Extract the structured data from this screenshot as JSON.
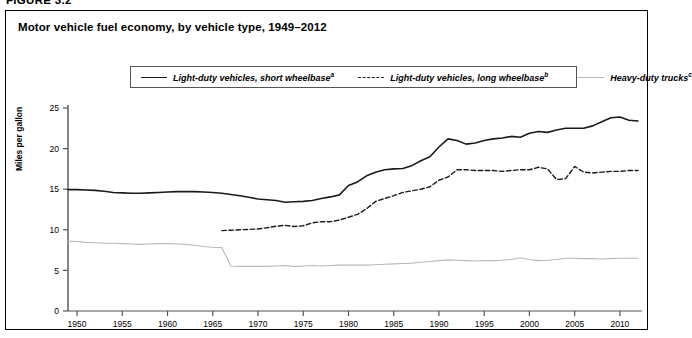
{
  "figure": {
    "number_label": "FIGURE 3.2"
  },
  "panel": {
    "title": "Motor vehicle fuel economy, by vehicle type, 1949–2012"
  },
  "legend": {
    "position": "top-center",
    "entries": [
      {
        "label": "Light-duty vehicles, short wheelbase",
        "footnote": "a",
        "style": "solid",
        "color": "#1a1a1a"
      },
      {
        "label": "Light-duty vehicles, long wheelbase",
        "footnote": "b",
        "style": "dashed",
        "color": "#1a1a1a"
      },
      {
        "label": "Heavy-duty trucks",
        "footnote": "c",
        "style": "solid",
        "color": "#b9b9b9"
      }
    ]
  },
  "chart_data": {
    "type": "line",
    "title": "Motor vehicle fuel economy, by vehicle type, 1949–2012",
    "xlabel": "",
    "ylabel": "Miles per gallon",
    "xlim": [
      1949,
      2012
    ],
    "ylim": [
      0,
      25
    ],
    "y_ticks": [
      0,
      5,
      10,
      15,
      20,
      25
    ],
    "x_ticks": [
      1950,
      1955,
      1960,
      1965,
      1970,
      1975,
      1980,
      1985,
      1990,
      1995,
      2000,
      2005,
      2010
    ],
    "grid": false,
    "legend_position": "top-center",
    "series": [
      {
        "name": "Light-duty vehicles, short wheelbase",
        "footnote": "a",
        "style": "solid",
        "color": "#1a1a1a",
        "x": [
          1949,
          1950,
          1951,
          1952,
          1953,
          1954,
          1955,
          1956,
          1957,
          1958,
          1959,
          1960,
          1961,
          1962,
          1963,
          1964,
          1965,
          1966,
          1967,
          1968,
          1969,
          1970,
          1971,
          1972,
          1973,
          1974,
          1975,
          1976,
          1977,
          1978,
          1979,
          1980,
          1981,
          1982,
          1983,
          1984,
          1985,
          1986,
          1987,
          1988,
          1989,
          1990,
          1991,
          1992,
          1993,
          1994,
          1995,
          1996,
          1997,
          1998,
          1999,
          2000,
          2001,
          2002,
          2003,
          2004,
          2005,
          2006,
          2007,
          2008,
          2009,
          2010,
          2011,
          2012
        ],
        "y": [
          14.95,
          14.95,
          14.9,
          14.85,
          14.75,
          14.6,
          14.55,
          14.5,
          14.5,
          14.55,
          14.6,
          14.65,
          14.7,
          14.7,
          14.7,
          14.65,
          14.6,
          14.5,
          14.35,
          14.2,
          14.0,
          13.8,
          13.7,
          13.6,
          13.4,
          13.45,
          13.5,
          13.6,
          13.85,
          14.05,
          14.3,
          15.45,
          15.9,
          16.65,
          17.1,
          17.4,
          17.5,
          17.55,
          17.9,
          18.5,
          19.0,
          20.2,
          21.2,
          21.0,
          20.55,
          20.7,
          21.0,
          21.2,
          21.3,
          21.5,
          21.4,
          21.9,
          22.1,
          22.0,
          22.3,
          22.5,
          22.5,
          22.5,
          22.8,
          23.3,
          23.8,
          23.9,
          23.5,
          23.4
        ]
      },
      {
        "name": "Light-duty vehicles, long wheelbase",
        "footnote": "b",
        "style": "dashed",
        "color": "#1a1a1a",
        "x": [
          1966,
          1967,
          1968,
          1969,
          1970,
          1971,
          1972,
          1973,
          1974,
          1975,
          1976,
          1977,
          1978,
          1979,
          1980,
          1981,
          1982,
          1983,
          1984,
          1985,
          1986,
          1987,
          1988,
          1989,
          1990,
          1991,
          1992,
          1993,
          1994,
          1995,
          1996,
          1997,
          1998,
          1999,
          2000,
          2001,
          2002,
          2003,
          2004,
          2005,
          2006,
          2007,
          2008,
          2009,
          2010,
          2011,
          2012
        ],
        "y": [
          9.9,
          9.95,
          10.0,
          10.05,
          10.1,
          10.25,
          10.45,
          10.55,
          10.4,
          10.5,
          10.85,
          11.0,
          11.0,
          11.2,
          11.55,
          11.9,
          12.6,
          13.5,
          13.85,
          14.2,
          14.6,
          14.8,
          15.0,
          15.3,
          16.1,
          16.5,
          17.4,
          17.4,
          17.3,
          17.3,
          17.3,
          17.2,
          17.3,
          17.4,
          17.4,
          17.7,
          17.5,
          16.2,
          16.3,
          17.8,
          17.1,
          17.0,
          17.1,
          17.2,
          17.2,
          17.3,
          17.3
        ]
      },
      {
        "name": "Heavy-duty trucks",
        "footnote": "c",
        "style": "solid",
        "color": "#b9b9b9",
        "x": [
          1949,
          1950,
          1951,
          1952,
          1953,
          1954,
          1955,
          1956,
          1957,
          1958,
          1959,
          1960,
          1961,
          1962,
          1963,
          1964,
          1965,
          1966,
          1967,
          1968,
          1969,
          1970,
          1971,
          1972,
          1973,
          1974,
          1975,
          1976,
          1977,
          1978,
          1979,
          1980,
          1981,
          1982,
          1983,
          1984,
          1985,
          1986,
          1987,
          1988,
          1989,
          1990,
          1991,
          1992,
          1993,
          1994,
          1995,
          1996,
          1997,
          1998,
          1999,
          2000,
          2001,
          2002,
          2003,
          2004,
          2005,
          2006,
          2007,
          2008,
          2009,
          2010,
          2011,
          2012
        ],
        "y": [
          8.6,
          8.55,
          8.45,
          8.4,
          8.35,
          8.35,
          8.3,
          8.25,
          8.2,
          8.25,
          8.3,
          8.3,
          8.25,
          8.2,
          8.1,
          7.95,
          7.85,
          7.8,
          5.55,
          5.5,
          5.5,
          5.5,
          5.5,
          5.55,
          5.6,
          5.5,
          5.55,
          5.6,
          5.55,
          5.6,
          5.65,
          5.65,
          5.65,
          5.65,
          5.7,
          5.75,
          5.8,
          5.85,
          5.9,
          6.0,
          6.1,
          6.2,
          6.3,
          6.25,
          6.2,
          6.15,
          6.2,
          6.2,
          6.25,
          6.35,
          6.55,
          6.35,
          6.2,
          6.25,
          6.35,
          6.5,
          6.5,
          6.45,
          6.45,
          6.4,
          6.45,
          6.5,
          6.5,
          6.5
        ]
      }
    ]
  }
}
